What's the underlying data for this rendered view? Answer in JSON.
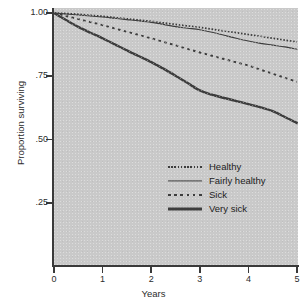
{
  "chart_data": {
    "type": "line",
    "title": "",
    "xlabel": "Years",
    "ylabel": "Proportion surviving",
    "xlim": [
      0,
      5
    ],
    "ylim": [
      0,
      1.0
    ],
    "grid": false,
    "legend_position": "inside-right-middle",
    "x_ticks": [
      "0",
      "1",
      "2",
      "3",
      "4",
      "5"
    ],
    "x_tick_values": [
      0,
      1,
      2,
      3,
      4,
      5
    ],
    "y_ticks": [
      "1.00",
      ".75",
      ".50",
      ".25"
    ],
    "y_tick_values": [
      1.0,
      0.75,
      0.5,
      0.25
    ],
    "x": [
      0,
      0.25,
      0.5,
      0.75,
      1,
      1.25,
      1.5,
      1.75,
      2,
      2.25,
      2.5,
      2.75,
      3,
      3.25,
      3.5,
      3.75,
      4,
      4.25,
      4.5,
      4.75,
      5
    ],
    "series": [
      {
        "name": "Healthy",
        "style": "fine-dotted",
        "values": [
          1.0,
          0.998,
          0.995,
          0.991,
          0.987,
          0.982,
          0.977,
          0.972,
          0.967,
          0.961,
          0.955,
          0.949,
          0.943,
          0.936,
          0.929,
          0.922,
          0.915,
          0.908,
          0.9,
          0.893,
          0.886
        ]
      },
      {
        "name": "Fairly healthy",
        "style": "thin-solid",
        "values": [
          1.0,
          0.996,
          0.992,
          0.988,
          0.984,
          0.979,
          0.974,
          0.969,
          0.963,
          0.955,
          0.946,
          0.94,
          0.934,
          0.924,
          0.912,
          0.9,
          0.889,
          0.88,
          0.873,
          0.866,
          0.857
        ]
      },
      {
        "name": "Sick",
        "style": "dashed",
        "values": [
          1.0,
          0.988,
          0.976,
          0.964,
          0.952,
          0.939,
          0.926,
          0.913,
          0.9,
          0.886,
          0.872,
          0.858,
          0.844,
          0.831,
          0.818,
          0.805,
          0.792,
          0.776,
          0.76,
          0.744,
          0.728
        ]
      },
      {
        "name": "Very sick",
        "style": "thick-solid",
        "values": [
          1.0,
          0.972,
          0.945,
          0.922,
          0.9,
          0.876,
          0.852,
          0.829,
          0.806,
          0.78,
          0.752,
          0.723,
          0.694,
          0.677,
          0.664,
          0.652,
          0.64,
          0.627,
          0.612,
          0.589,
          0.565
        ]
      }
    ]
  },
  "axes": {
    "ylabel": "Proportion surviving",
    "xlabel": "Years"
  },
  "legend": {
    "items": [
      {
        "label": "Healthy"
      },
      {
        "label": "Fairly healthy"
      },
      {
        "label": "Sick"
      },
      {
        "label": "Very sick"
      }
    ]
  },
  "caption": {
    "text": ""
  },
  "colors": {
    "plot_background": "#c9c9c9",
    "page_background": "#ffffff",
    "line": "#3d3d3d",
    "axis": "#3a3a3a",
    "text": "#2c2c2c"
  }
}
